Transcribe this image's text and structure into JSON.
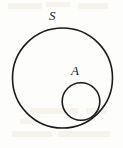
{
  "figure": {
    "type": "set-diagram",
    "background_color": "#fdfdfc",
    "stroke_color": "#1a1a1a",
    "label_color": "#1a1a1a",
    "canvas": {
      "width": 123,
      "height": 148
    },
    "labels": {
      "universe": "S",
      "subset": "A"
    },
    "shapes": {
      "universe_circle": {
        "name": "S",
        "cx": 62.5,
        "cy": 78,
        "r": 50,
        "stroke_width": 1.6,
        "fill": "none"
      },
      "subset_circle": {
        "name": "A",
        "cx": 81,
        "cy": 101.5,
        "r": 18.8,
        "stroke_width": 1.6,
        "fill": "none"
      }
    },
    "artifacts": [
      {
        "x": 8,
        "y": 3,
        "w": 34,
        "h": 6
      },
      {
        "x": 46,
        "y": 2,
        "w": 24,
        "h": 5
      },
      {
        "x": 78,
        "y": 3,
        "w": 30,
        "h": 6
      },
      {
        "x": 30,
        "y": 108,
        "w": 48,
        "h": 6
      },
      {
        "x": 86,
        "y": 108,
        "w": 20,
        "h": 6
      },
      {
        "x": 12,
        "y": 131,
        "w": 40,
        "h": 6
      },
      {
        "x": 58,
        "y": 131,
        "w": 52,
        "h": 6
      },
      {
        "x": 20,
        "y": 119,
        "w": 16,
        "h": 5
      }
    ]
  }
}
